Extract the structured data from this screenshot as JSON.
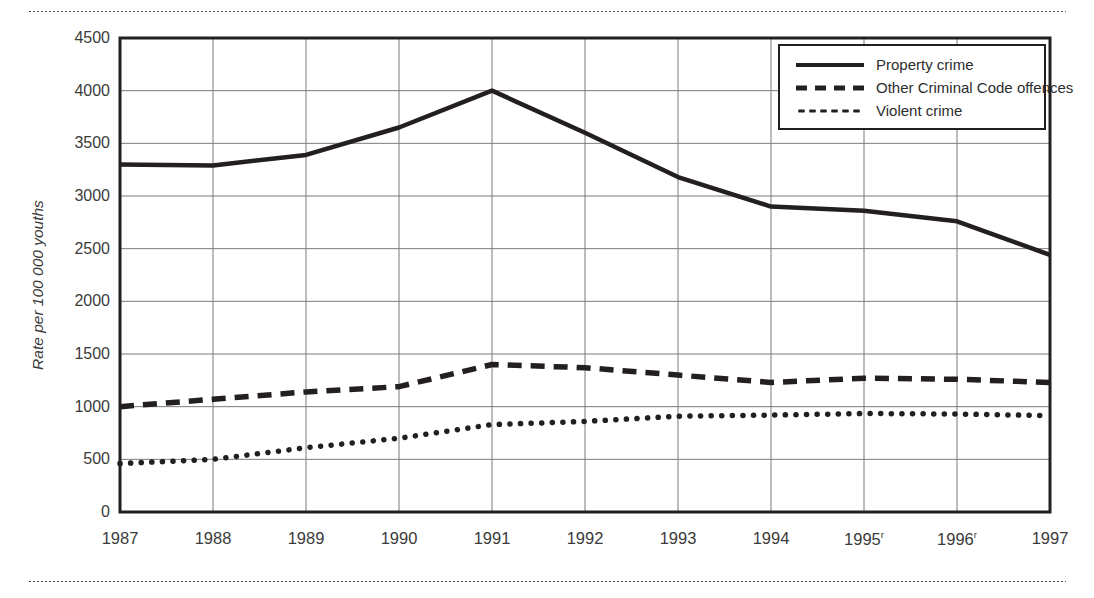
{
  "chart_data": {
    "type": "line",
    "title": "",
    "xlabel": "",
    "ylabel": "Rate per 100 000 youths",
    "ylim": [
      0,
      4500
    ],
    "ytick_step": 500,
    "grid": true,
    "legend_position": "top-right",
    "x": [
      "1987",
      "1988",
      "1989",
      "1990",
      "1991",
      "1992",
      "1993",
      "1994",
      "1995",
      "1996",
      "1997"
    ],
    "x_tick_labels": [
      "1987",
      "1988",
      "1989",
      "1990",
      "1991",
      "1992",
      "1993",
      "1994",
      "1995",
      "1996",
      "1997"
    ],
    "x_tick_superscripts": [
      "",
      "",
      "",
      "",
      "",
      "",
      "",
      "",
      "r",
      "r",
      ""
    ],
    "y_tick_labels": [
      "4500",
      "4000",
      "3500",
      "3000",
      "2500",
      "2000",
      "1500",
      "1000",
      "500",
      "0"
    ],
    "y_ticks": [
      4500,
      4000,
      3500,
      3000,
      2500,
      2000,
      1500,
      1000,
      500,
      0
    ],
    "series": [
      {
        "name": "Property crime",
        "style": "solid",
        "color": "#231f20",
        "values": [
          3300,
          3290,
          3390,
          3650,
          4000,
          3600,
          3180,
          2900,
          2860,
          2760,
          2440
        ]
      },
      {
        "name": "Other Criminal Code offences",
        "style": "dashed",
        "color": "#231f20",
        "values": [
          1000,
          1070,
          1140,
          1190,
          1400,
          1370,
          1300,
          1230,
          1270,
          1260,
          1230
        ]
      },
      {
        "name": "Violent crime",
        "style": "dotted",
        "color": "#231f20",
        "values": [
          460,
          500,
          610,
          700,
          830,
          860,
          910,
          920,
          935,
          930,
          915
        ]
      }
    ]
  },
  "legend": {
    "entries": [
      {
        "label": "Property crime",
        "style": "solid"
      },
      {
        "label": "Other Criminal Code offences",
        "style": "dashed"
      },
      {
        "label": "Violent crime",
        "style": "dotted"
      }
    ]
  },
  "axis": {
    "y_title": "Rate per 100 000 youths"
  }
}
